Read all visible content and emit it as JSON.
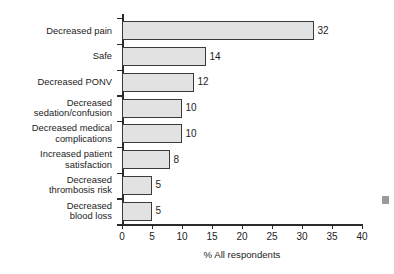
{
  "chart_data": {
    "type": "bar",
    "orientation": "horizontal",
    "title": "",
    "subtitle": "",
    "xlabel": "% All respondents",
    "ylabel": "",
    "categories": [
      "Decreased pain",
      "Safe",
      "Decreased PONV",
      "Decreased\nsedation/confusion",
      "Decreased medical\ncomplications",
      "Increased patient\nsatisfaction",
      "Decreased\nthrombosis risk",
      "Decreased\nblood loss"
    ],
    "values": [
      32,
      14,
      12,
      10,
      10,
      8,
      5,
      5
    ],
    "value_labels": [
      "32",
      "14",
      "12",
      "10",
      "10",
      "8",
      "5",
      "5"
    ],
    "xlim": [
      0,
      40
    ],
    "xticks": [
      0,
      5,
      10,
      15,
      20,
      25,
      30,
      35,
      40
    ],
    "xtick_labels": [
      "0",
      "5",
      "10",
      "15",
      "20",
      "25",
      "30",
      "35",
      "40"
    ],
    "grid": false,
    "legend": null,
    "legend_position": "none",
    "bar_fill_color": "#e2e2e2",
    "bar_border_color": "#3a3a3a",
    "axis_color": "#2b2b2b",
    "background_color": "#ffffff",
    "text_color": "#1d1d1d"
  }
}
